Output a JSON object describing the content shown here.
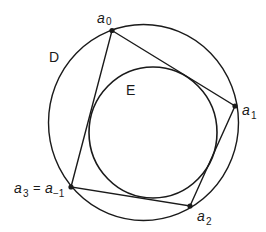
{
  "diagram": {
    "colors": {
      "stroke": "#1a1a1a",
      "background": "#ffffff"
    },
    "outer_circle": {
      "label": "D",
      "cx": 143.5,
      "cy": 122.5,
      "rx": 95,
      "ry": 98
    },
    "inner_circle": {
      "label": "E",
      "cx": 153,
      "cy": 132.5,
      "rx": 64,
      "ry": 65.5
    },
    "vertices": [
      {
        "name": "a",
        "sub": "0",
        "x": 112,
        "y": 30.5
      },
      {
        "name": "a",
        "sub": "1",
        "x": 235,
        "y": 106
      },
      {
        "name": "a",
        "sub": "2",
        "x": 190,
        "y": 206
      },
      {
        "name": "a",
        "sub": "3",
        "x": 71,
        "y": 187,
        "equals": "=",
        "alias_name": "a",
        "alias_sub": "−1"
      }
    ]
  }
}
